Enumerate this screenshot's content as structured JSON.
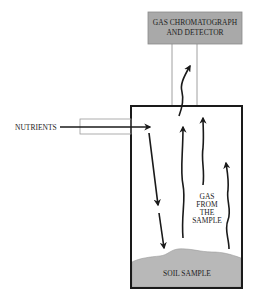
{
  "diagram": {
    "gc_box": {
      "line1": "GAS CHROMATOGRAPH",
      "line2": "AND DETECTOR",
      "fill": "#a9a9a9"
    },
    "inlet_label": "NUTRIENTS",
    "gas_label": [
      "GAS",
      "FROM",
      "THE",
      "SAMPLE"
    ],
    "soil_label": "SOIL SAMPLE",
    "soil_fill": "#b8b8b8",
    "line_color": "#1a1a1a"
  }
}
